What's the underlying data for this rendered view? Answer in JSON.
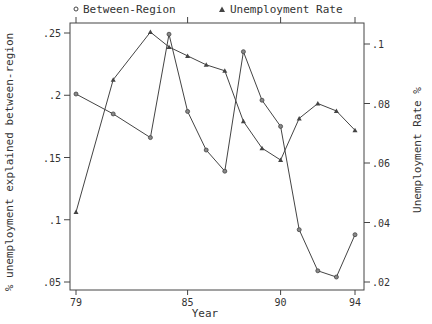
{
  "legend": {
    "series1": {
      "symbol": "circle",
      "label": "Between-Region"
    },
    "series2": {
      "symbol": "triangle",
      "label": "Unemployment Rate"
    }
  },
  "axes": {
    "xlabel": "Year",
    "ylabel_left": "% unemployment explained between-region",
    "ylabel_right": "Unemployment Rate %"
  },
  "chart_data": {
    "type": "line",
    "title": "",
    "xlabel": "Year",
    "ylabel": "% unemployment explained between-region",
    "ylabel_right": "Unemployment Rate %",
    "x": [
      79,
      81,
      83,
      84,
      85,
      86,
      87,
      88,
      89,
      90,
      91,
      92,
      93,
      94
    ],
    "x_ticks": [
      "79",
      "85",
      "90",
      "94"
    ],
    "xlim": [
      79,
      94
    ],
    "ylim_left": [
      0.05,
      0.25
    ],
    "y_ticks_left": [
      ".25",
      ".2",
      ".15",
      ".1",
      ".05"
    ],
    "ylim_right": [
      0.02,
      0.1
    ],
    "y_ticks_right": [
      ".1",
      ".08",
      ".06",
      ".04",
      ".02"
    ],
    "grid": false,
    "legend_position": "top",
    "series": [
      {
        "name": "Between-Region",
        "axis": "left",
        "marker": "circle",
        "values": [
          0.201,
          0.185,
          0.166,
          0.249,
          0.187,
          0.156,
          0.139,
          0.235,
          0.196,
          0.175,
          0.092,
          0.059,
          0.054,
          0.088
        ]
      },
      {
        "name": "Unemployment Rate",
        "axis": "right",
        "marker": "triangle",
        "values": [
          0.0435,
          0.088,
          0.104,
          0.099,
          0.096,
          0.093,
          0.091,
          0.074,
          0.065,
          0.061,
          0.075,
          0.08,
          0.0775,
          0.071
        ]
      }
    ]
  }
}
